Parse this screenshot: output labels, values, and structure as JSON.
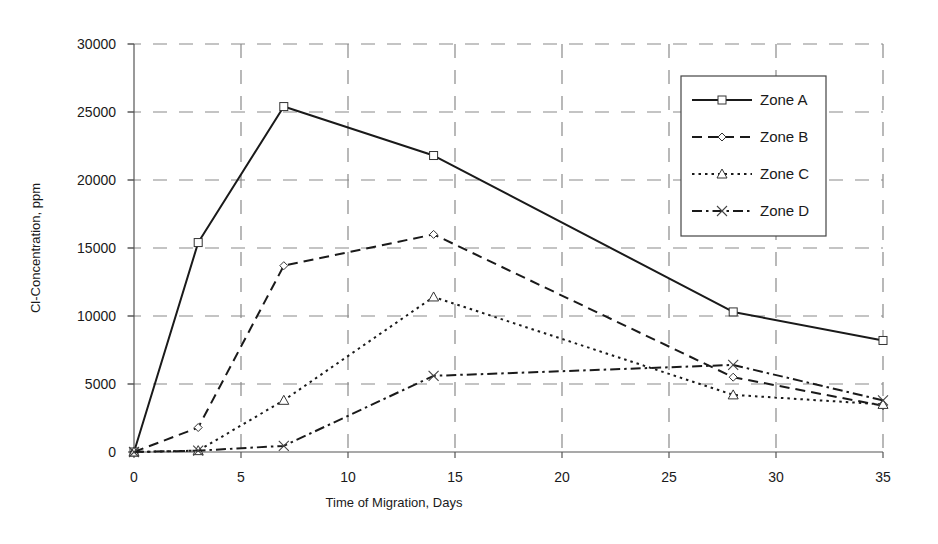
{
  "chart_data": {
    "type": "line",
    "title": "",
    "xlabel": "Time of Migration, Days",
    "ylabel": "Cl-Concentration, ppm",
    "xlim": [
      0,
      35
    ],
    "ylim": [
      0,
      30000
    ],
    "x_ticks": [
      0,
      5,
      10,
      15,
      20,
      25,
      30,
      35
    ],
    "y_ticks": [
      0,
      5000,
      10000,
      15000,
      20000,
      25000,
      30000
    ],
    "grid": true,
    "grid_style": "dashed",
    "legend_position": "upper right (inside)",
    "x": [
      0,
      3,
      7,
      14,
      28,
      35
    ],
    "series": [
      {
        "name": "Zone A",
        "marker": "square",
        "line": "solid",
        "values": [
          0,
          15400,
          25400,
          21800,
          10300,
          8200
        ]
      },
      {
        "name": "Zone B",
        "marker": "diamond",
        "line": "dashed",
        "values": [
          0,
          1800,
          13700,
          16000,
          5500,
          3400
        ]
      },
      {
        "name": "Zone C",
        "marker": "triangle",
        "line": "dotted",
        "values": [
          0,
          100,
          3800,
          11400,
          4200,
          3500
        ]
      },
      {
        "name": "Zone D",
        "marker": "x",
        "line": "dash-dot",
        "values": [
          0,
          100,
          450,
          5600,
          6400,
          3800
        ]
      }
    ]
  },
  "colors": {
    "line": "#1a1a1a",
    "grid": "#8a8a8a",
    "axis": "#555555",
    "background": "#ffffff"
  }
}
